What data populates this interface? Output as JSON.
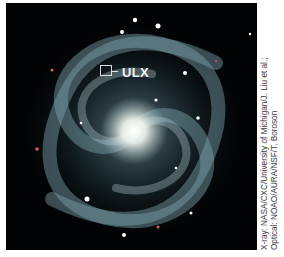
{
  "image": {
    "subject": "spiral galaxy",
    "annotation": {
      "label": "ULX",
      "marker": "square-box-marker"
    }
  },
  "credit": {
    "line1": "X-ray: NASA/CXC/University of Michigan/J. Liu et al.;",
    "line2": "Optical: NOAO/AURA/NSF/T. Boroson"
  },
  "colors": {
    "sky": "#020304",
    "arm": "#6f9aa8",
    "core": "#ffffff",
    "text": "#f2f4f4"
  }
}
